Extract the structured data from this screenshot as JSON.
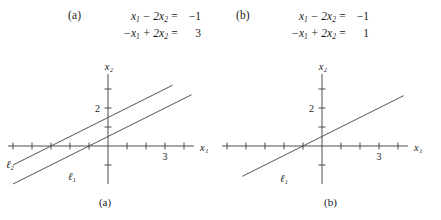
{
  "figure": {
    "systems": [
      {
        "tag": "(a)",
        "equations": [
          {
            "lhs_html": "x<sub>1</sub> &#8722; 2x<sub>2</sub>",
            "eq": "=",
            "rhs": "−1"
          },
          {
            "lhs_html": "−x<sub>1</sub> + 2x<sub>2</sub>",
            "eq": "=",
            "rhs": "3"
          }
        ]
      },
      {
        "tag": "(b)",
        "equations": [
          {
            "lhs_html": "x<sub>1</sub> &#8722; 2x<sub>2</sub>",
            "eq": "=",
            "rhs": "−1"
          },
          {
            "lhs_html": "−x<sub>1</sub> + 2x<sub>2</sub>",
            "eq": "=",
            "rhs": "1"
          }
        ]
      }
    ],
    "captions": {
      "a": "(a)",
      "b": "(b)"
    },
    "axis_labels": {
      "x": "x₁",
      "y": "x₂"
    },
    "line_labels": {
      "l1": "ℓ₁",
      "l2": "ℓ₂"
    },
    "colors": {
      "axis": "#3a3a3a",
      "line": "#4a4a4a",
      "text": "#1a1a1a"
    }
  },
  "chart_data": [
    {
      "type": "line",
      "title": "(a)",
      "xlabel": "x_1",
      "ylabel": "x_2",
      "xlim": [
        -5.2,
        4.8
      ],
      "ylim": [
        -1.6,
        3.6
      ],
      "grid": false,
      "legend": "inline-labels",
      "xticks": [
        -5,
        -4,
        -3,
        -2,
        -1,
        1,
        2,
        3,
        4
      ],
      "xtick_labels": [
        "",
        "",
        "",
        "",
        "",
        "",
        "",
        "3",
        ""
      ],
      "yticks": [
        -1,
        1,
        2,
        3
      ],
      "ytick_labels": [
        "",
        "",
        "2",
        ""
      ],
      "series": [
        {
          "name": "ℓ₁",
          "equation": "x_1 - 2x_2 = -1",
          "slope": 0.5,
          "y_intercept": 0.5,
          "x_intercept": -1,
          "points": [
            [
              -5.0,
              -2.0
            ],
            [
              4.4,
              2.7
            ]
          ]
        },
        {
          "name": "ℓ₂",
          "equation": "-x_1 + 2x_2 = 3",
          "slope": 0.5,
          "y_intercept": 1.5,
          "x_intercept": -3,
          "points": [
            [
              -5.0,
              -1.0
            ],
            [
              3.4,
              3.2
            ]
          ]
        }
      ],
      "annotation": "Parallel lines — no solution"
    },
    {
      "type": "line",
      "title": "(b)",
      "xlabel": "x_1",
      "ylabel": "x_2",
      "xlim": [
        -5.2,
        4.8
      ],
      "ylim": [
        -1.6,
        3.6
      ],
      "grid": false,
      "legend": "inline-labels",
      "xticks": [
        -5,
        -4,
        -3,
        -2,
        -1,
        1,
        2,
        3,
        4
      ],
      "xtick_labels": [
        "",
        "",
        "",
        "",
        "",
        "",
        "",
        "3",
        ""
      ],
      "yticks": [
        -1,
        1,
        2,
        3
      ],
      "ytick_labels": [
        "",
        "",
        "2",
        ""
      ],
      "series": [
        {
          "name": "ℓ₁",
          "equation": "x_1 - 2x_2 = -1",
          "slope": 0.5,
          "y_intercept": 0.5,
          "x_intercept": -1,
          "points": [
            [
              -4.2,
              -1.6
            ],
            [
              4.3,
              2.65
            ]
          ]
        }
      ],
      "annotation": "Coincident lines — infinitely many solutions"
    }
  ]
}
